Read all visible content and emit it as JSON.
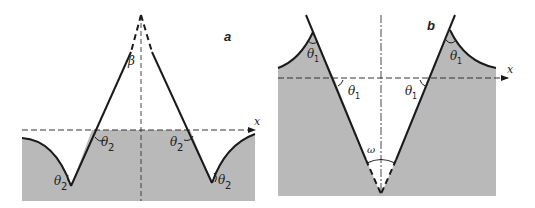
{
  "figure": {
    "panels": [
      {
        "id": "a",
        "label": "a",
        "axis_label": "x",
        "apex_angle_label": "β",
        "angle_labels": [
          "θ",
          "θ",
          "θ",
          "θ"
        ],
        "angle_subscripts": [
          "2",
          "2",
          "2",
          "2"
        ]
      },
      {
        "id": "b",
        "label": "b",
        "axis_label": "x",
        "apex_angle_label": "ω",
        "angle_labels": [
          "θ",
          "θ",
          "θ",
          "θ"
        ],
        "angle_subscripts": [
          "1",
          "1",
          "1",
          "1"
        ]
      }
    ],
    "colors": {
      "fill": "#b9b9b9",
      "line": "#1a1a1a",
      "background": "#ffffff"
    }
  }
}
